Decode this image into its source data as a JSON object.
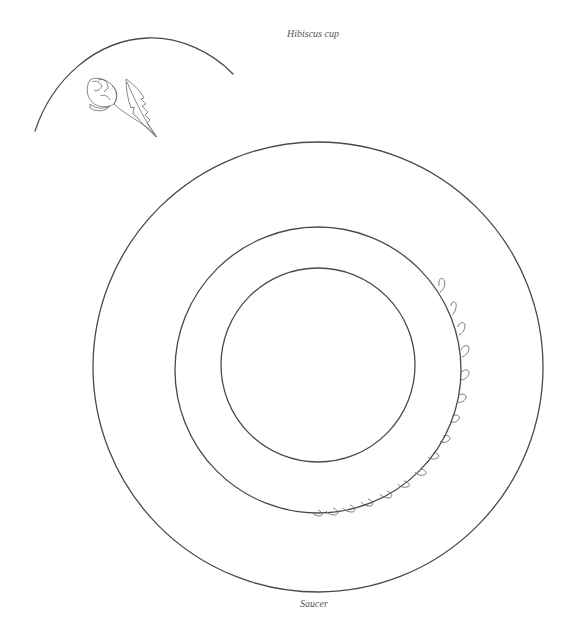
{
  "captions": {
    "cup": "Hibiscus cup",
    "saucer": "Saucer"
  },
  "colors": {
    "line": "#4a4a4a",
    "motif": "#6a6a6a",
    "background": "#ffffff"
  },
  "drawings": {
    "cup": {
      "description": "Partial arc of hibiscus cup with hibiscus bud and leaf motif",
      "motifs": [
        "hibiscus-bud",
        "hibiscus-leaf"
      ]
    },
    "saucer": {
      "description": "Three concentric circles with teardrop leaf garland along lower-right of middle ring",
      "rings": [
        "outer-rim",
        "middle-ring",
        "inner-well"
      ],
      "garland_leaf_count": 16
    }
  }
}
